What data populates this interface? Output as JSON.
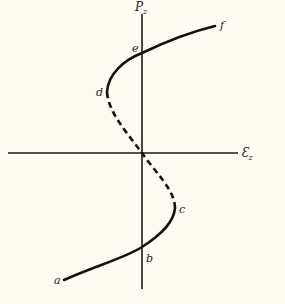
{
  "axes": {
    "x_label": "Ɛ",
    "x_subscript": "z",
    "y_label": "P",
    "y_subscript": "z"
  },
  "points": {
    "a": "a",
    "b": "b",
    "c": "c",
    "d": "d",
    "e": "e",
    "f": "f"
  },
  "curve": {
    "solid_segments": [
      "a-c",
      "d-f"
    ],
    "dashed_segment": "c-d (through origin)"
  }
}
